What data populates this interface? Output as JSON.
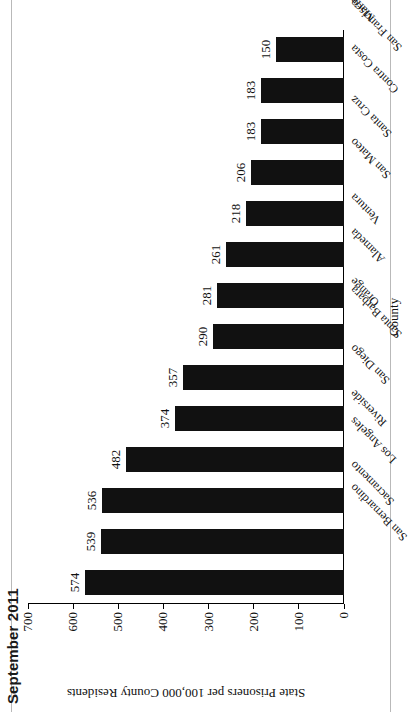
{
  "chart_data": {
    "type": "bar",
    "title": "September 2011",
    "xlabel": "County",
    "ylabel": "State Prisoners per 100,000 County Residents",
    "ylim": [
      0,
      700
    ],
    "ytick_step": 100,
    "ytick_labels": [
      "0",
      "100",
      "200",
      "300",
      "400",
      "500",
      "600",
      "700"
    ],
    "grid": false,
    "legend": false,
    "orientation": "vertical-bars-rotated-page",
    "bar_color": "#111111",
    "categories": [
      "San Bernardino",
      "Sacramento",
      "Los Angeles",
      "Riverside",
      "San Diego",
      "Santa Barbara",
      "Orange",
      "Alameda",
      "Ventura",
      "San Mateo",
      "Santa Cruz",
      "Contra Costa",
      "San Francisco",
      "Marin"
    ],
    "values": [
      574,
      539,
      536,
      482,
      374,
      357,
      290,
      281,
      261,
      218,
      206,
      183,
      183,
      150
    ],
    "data_labels": [
      "574",
      "539",
      "536",
      "482",
      "374",
      "357",
      "290",
      "281",
      "261",
      "218",
      "206",
      "183",
      "183",
      "150"
    ]
  }
}
